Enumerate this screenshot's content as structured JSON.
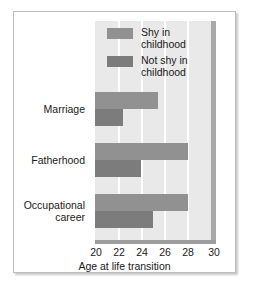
{
  "chart_data": {
    "type": "bar",
    "orientation": "horizontal",
    "title": "",
    "xlabel": "Age at life transition",
    "ylabel": "",
    "categories": [
      "Marriage",
      "Fatherhood",
      "Occupational career"
    ],
    "series": [
      {
        "name": "Shy in childhood",
        "color": "#919191",
        "values": [
          25.4,
          28.0,
          28.0
        ]
      },
      {
        "name": "Not shy in childhood",
        "color": "#7c7c7c",
        "values": [
          22.4,
          24.0,
          25.0
        ]
      }
    ],
    "xlim": [
      20,
      30
    ],
    "xticks": [
      20,
      22,
      24,
      26,
      28,
      30
    ],
    "xtick_labels": [
      "20",
      "22",
      "24",
      "26",
      "28",
      "30"
    ],
    "grid": "vertical-white-gridlines",
    "legend_position": "top-center-inside"
  },
  "legend": {
    "items": [
      {
        "label": "Shy in childhood",
        "label_line1": "Shy in childhood",
        "label_line2": ""
      },
      {
        "label": "Not shy in childhood",
        "label_line1": "Not shy in",
        "label_line2": "childhood"
      }
    ]
  },
  "axis": {
    "x_title": "Age at life transition",
    "ticks": [
      "20",
      "22",
      "24",
      "26",
      "28",
      "30"
    ]
  },
  "categories": [
    {
      "line1": "Marriage",
      "line2": ""
    },
    {
      "line1": "Fatherhood",
      "line2": ""
    },
    {
      "line1": "Occupational",
      "line2": "career"
    }
  ],
  "colors": {
    "shy": "#919191",
    "not_shy": "#7c7c7c",
    "plot_background": "#e9e9e9",
    "gridline": "#ffffff",
    "side_wall": "#a8a8a8",
    "floor": "#9d9d9d",
    "card_border": "#b9bcc0",
    "text": "#1a1a1a"
  }
}
